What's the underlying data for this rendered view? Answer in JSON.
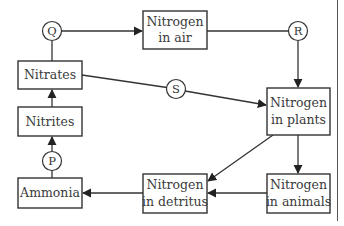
{
  "diagram": {
    "type": "flow-diagram",
    "nodes": {
      "air": {
        "lines": [
          "Nitrogen",
          "in air"
        ]
      },
      "nitrates": {
        "lines": [
          "Nitrates"
        ]
      },
      "nitrites": {
        "lines": [
          "Nitrites"
        ]
      },
      "ammonia": {
        "lines": [
          "Ammonia"
        ]
      },
      "plants": {
        "lines": [
          "Nitrogen",
          "in plants"
        ]
      },
      "detritus": {
        "lines": [
          "Nitrogen",
          "in detritus"
        ]
      },
      "animals": {
        "lines": [
          "Nitrogen",
          "in animals"
        ]
      }
    },
    "process_labels": {
      "P": "P",
      "Q": "Q",
      "R": "R",
      "S": "S"
    },
    "edges": [
      {
        "from": "Nitrates",
        "to": "Nitrogen in air",
        "via": "Q"
      },
      {
        "from": "Nitrogen in air",
        "to": "Nitrogen in plants",
        "via": "R"
      },
      {
        "from": "Nitrates",
        "to": "Nitrogen in plants",
        "via": "S"
      },
      {
        "from": "Nitrites",
        "to": "Nitrates"
      },
      {
        "from": "Ammonia",
        "to": "Nitrites",
        "via": "P"
      },
      {
        "from": "Nitrogen in plants",
        "to": "Nitrogen in animals"
      },
      {
        "from": "Nitrogen in plants",
        "to": "Nitrogen in detritus"
      },
      {
        "from": "Nitrogen in animals",
        "to": "Nitrogen in detritus"
      },
      {
        "from": "Nitrogen in detritus",
        "to": "Ammonia"
      }
    ],
    "colors": {
      "stroke": "#333333",
      "text": "#3a3a3a",
      "background": "#ffffff"
    }
  }
}
